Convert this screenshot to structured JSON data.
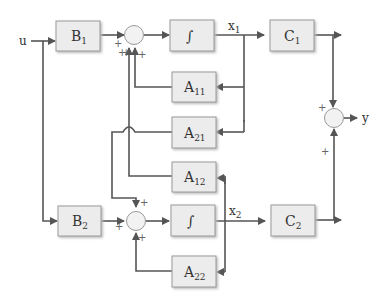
{
  "diagram": {
    "type": "state-space block diagram (two-state)",
    "input_label": "u",
    "output_label": "y",
    "blocks": {
      "B1": {
        "main": "B",
        "sub": "1"
      },
      "B2": {
        "main": "B",
        "sub": "2"
      },
      "int1": {
        "main": "∫"
      },
      "int2": {
        "main": "∫"
      },
      "C1": {
        "main": "C",
        "sub": "1"
      },
      "C2": {
        "main": "C",
        "sub": "2"
      },
      "A11": {
        "main": "A",
        "sub": "11"
      },
      "A21": {
        "main": "A",
        "sub": "21"
      },
      "A12": {
        "main": "A",
        "sub": "12"
      },
      "A22": {
        "main": "A",
        "sub": "22"
      }
    },
    "signals": {
      "x1": {
        "main": "x",
        "sub": "1"
      },
      "x2": {
        "main": "x",
        "sub": "2"
      }
    },
    "signs": {
      "sum1_left": "+",
      "sum1_a12": "+",
      "sum1_a11": "+",
      "sum1_extra": "+",
      "sum2_top": "+",
      "sum2_left": "+",
      "sum2_bottom": "+",
      "out_top": "+",
      "out_bottom": "+"
    },
    "colors": {
      "line": "#555555",
      "block_fill": "#ececec",
      "block_border": "#9a9a9a"
    }
  }
}
